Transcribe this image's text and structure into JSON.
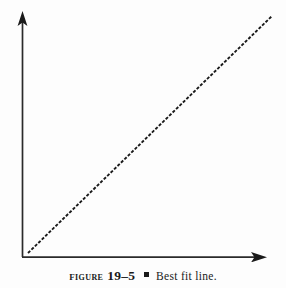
{
  "figure": {
    "label_word": "FIGURE",
    "number": "19–5",
    "separator_icon": "square-bullet",
    "caption_text": "Best fit line.",
    "background_color": "#fdfdfd",
    "ink_color": "#1a1a1a"
  },
  "chart_data": {
    "type": "line",
    "title": "",
    "subtitle": "",
    "xlabel": "",
    "ylabel": "",
    "grid": false,
    "legend": null,
    "axes": {
      "x_axis": {
        "start": [
          22,
          257
        ],
        "end": [
          265,
          257
        ],
        "arrow": "right",
        "ticks": [],
        "tick_labels": [],
        "label": ""
      },
      "y_axis": {
        "start": [
          22,
          257
        ],
        "end": [
          22,
          13
        ],
        "arrow": "up",
        "ticks": [],
        "tick_labels": [],
        "label": ""
      },
      "xlim": [
        0,
        1
      ],
      "ylim": [
        0,
        1
      ]
    },
    "series": [
      {
        "name": "best fit line",
        "style": "dotted",
        "color": "#1a1a1a",
        "x": [
          0,
          1
        ],
        "y": [
          0,
          1
        ],
        "pixel_start": [
          28,
          253
        ],
        "pixel_end": [
          272,
          16
        ],
        "slope_description": "positive linear, approximately 45 degrees"
      }
    ],
    "annotations": []
  }
}
